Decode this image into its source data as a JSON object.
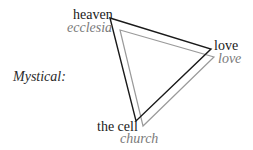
{
  "diagram": {
    "side_label": "Mystical:",
    "colors": {
      "primary": "#1a1a1a",
      "secondary": "#9a9a9a",
      "secondary_text": "#7a7a7a"
    },
    "triangles": [
      {
        "name": "primary-triangle",
        "vertices": [
          {
            "label": "heaven"
          },
          {
            "label": "love"
          },
          {
            "label": "the cell"
          }
        ]
      },
      {
        "name": "secondary-triangle",
        "vertices": [
          {
            "label": "ecclesia"
          },
          {
            "label": "love"
          },
          {
            "label": "church"
          }
        ]
      }
    ]
  }
}
